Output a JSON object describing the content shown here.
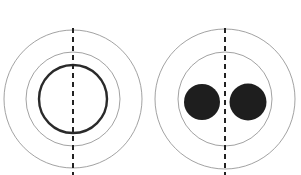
{
  "colors": {
    "background": "#ffffff",
    "ring": "#8a8a8a",
    "thick_ring": "#2a2a2a",
    "dash": "#222222",
    "fill": "#1e1e1e"
  },
  "diagrams": [
    {
      "id": "left",
      "center": [
        73,
        99
      ],
      "outer_r": 69,
      "middle_r": 47,
      "inner_ring_r": 34,
      "dash_x": 73,
      "dash_y": [
        28,
        175
      ]
    },
    {
      "id": "right",
      "center": [
        225,
        99
      ],
      "outer_r": 70,
      "middle_r": 47,
      "dots": [
        {
          "cx": 202,
          "cy": 102,
          "r": 18
        },
        {
          "cx": 248,
          "cy": 102,
          "r": 18.5
        }
      ],
      "dash_x": 225,
      "dash_y": [
        28,
        175
      ]
    }
  ]
}
